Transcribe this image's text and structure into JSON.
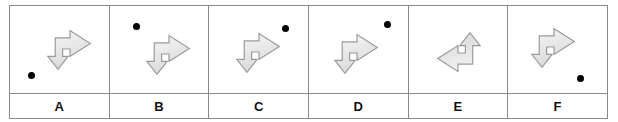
{
  "figure": {
    "type": "mental-rotation-answer-options",
    "panel_count": 6,
    "colors": {
      "border": "#8a8a8a",
      "arrow_outline": "#9a9a9a",
      "arrow_fill_light": "#f7f7f7",
      "arrow_fill_shade": "#d9d9d9",
      "dot": "#000000",
      "label_text": "#111111",
      "background": "#ffffff"
    },
    "panels": [
      {
        "label": "A",
        "arrow_name": "bent-arrow-right-down",
        "arrow_orientation": "right-then-down",
        "arrow_mirrored": false,
        "arrow_left_pct": 34,
        "arrow_top_pct": 22,
        "dot_visible": true,
        "dot_left_pct": 18,
        "dot_top_pct": 76
      },
      {
        "label": "B",
        "arrow_name": "bent-arrow-right-down",
        "arrow_orientation": "right-then-down",
        "arrow_mirrored": false,
        "arrow_left_pct": 34,
        "arrow_top_pct": 28,
        "dot_visible": true,
        "dot_left_pct": 24,
        "dot_top_pct": 19
      },
      {
        "label": "C",
        "arrow_name": "bent-arrow-right-down",
        "arrow_orientation": "right-then-down",
        "arrow_mirrored": false,
        "arrow_left_pct": 24,
        "arrow_top_pct": 25,
        "dot_visible": true,
        "dot_left_pct": 74,
        "dot_top_pct": 22
      },
      {
        "label": "D",
        "arrow_name": "bent-arrow-right-down",
        "arrow_orientation": "right-then-down",
        "arrow_mirrored": false,
        "arrow_left_pct": 22,
        "arrow_top_pct": 26,
        "dot_visible": true,
        "dot_left_pct": 76,
        "dot_top_pct": 17
      },
      {
        "label": "E",
        "arrow_name": "bent-arrow-up-right",
        "arrow_orientation": "up-then-right",
        "arrow_mirrored": true,
        "arrow_left_pct": 24,
        "arrow_top_pct": 27,
        "dot_visible": false,
        "dot_left_pct": 0,
        "dot_top_pct": 0
      },
      {
        "label": "F",
        "arrow_name": "bent-arrow-right-down",
        "arrow_orientation": "right-then-down",
        "arrow_mirrored": false,
        "arrow_left_pct": 20,
        "arrow_top_pct": 20,
        "dot_visible": true,
        "dot_left_pct": 70,
        "dot_top_pct": 79
      }
    ]
  }
}
